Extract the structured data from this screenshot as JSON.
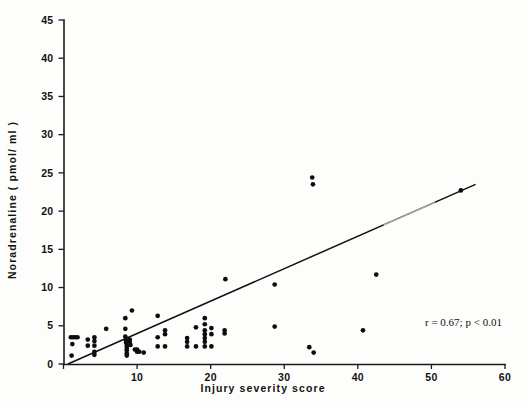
{
  "figure": {
    "background_color": "#fdfdfb",
    "ink_color": "#111111"
  },
  "annotation": {
    "text": "r = 0.67; p < 0.01",
    "r_value": 0.67,
    "p_text": "p < 0.01"
  },
  "chart_data": {
    "type": "scatter",
    "title": "",
    "subtitle": "",
    "xlabel": "Injury severity score",
    "ylabel": "Noradrenaline ( pmol/ ml )",
    "xlim": [
      0,
      60
    ],
    "ylim": [
      0,
      45
    ],
    "xticks": [
      0,
      10,
      20,
      30,
      40,
      50,
      60
    ],
    "xtick_labels": [
      "0",
      "10",
      "20",
      "30",
      "40",
      "50",
      "60"
    ],
    "yticks": [
      0,
      5,
      10,
      15,
      20,
      25,
      30,
      35,
      40,
      45
    ],
    "ytick_labels": [
      "0",
      "5",
      "10",
      "15",
      "20",
      "25",
      "30",
      "35",
      "40",
      "45"
    ],
    "grid": false,
    "legend": null,
    "annotations": [
      {
        "text": "r = 0.67; p < 0.01",
        "x": 48.5,
        "y": 4.6
      }
    ],
    "series": [
      {
        "name": "Noradrenaline vs Injury severity score",
        "marker": "filled-circle",
        "color": "#0d0d0d",
        "points": [
          [
            1.0,
            3.5
          ],
          [
            1.3,
            3.5
          ],
          [
            1.6,
            3.5
          ],
          [
            1.9,
            3.5
          ],
          [
            1.2,
            2.6
          ],
          [
            1.1,
            1.1
          ],
          [
            3.3,
            3.2
          ],
          [
            3.3,
            2.4
          ],
          [
            4.2,
            3.5
          ],
          [
            4.2,
            3.0
          ],
          [
            4.2,
            2.4
          ],
          [
            4.2,
            1.6
          ],
          [
            4.2,
            1.2
          ],
          [
            5.8,
            4.6
          ],
          [
            8.4,
            6.0
          ],
          [
            8.4,
            4.6
          ],
          [
            8.4,
            3.6
          ],
          [
            8.5,
            3.1
          ],
          [
            8.5,
            2.8
          ],
          [
            8.6,
            2.4
          ],
          [
            8.6,
            2.1
          ],
          [
            8.6,
            1.8
          ],
          [
            8.6,
            1.4
          ],
          [
            8.6,
            1.1
          ],
          [
            9.0,
            3.2
          ],
          [
            9.0,
            2.9
          ],
          [
            9.1,
            2.5
          ],
          [
            9.3,
            7.0
          ],
          [
            9.7,
            1.9
          ],
          [
            10.0,
            1.9
          ],
          [
            10.0,
            1.6
          ],
          [
            10.3,
            1.6
          ],
          [
            10.9,
            1.5
          ],
          [
            12.8,
            6.3
          ],
          [
            12.8,
            3.5
          ],
          [
            12.8,
            2.3
          ],
          [
            13.8,
            4.4
          ],
          [
            13.8,
            3.9
          ],
          [
            13.8,
            2.3
          ],
          [
            16.8,
            3.4
          ],
          [
            16.8,
            2.9
          ],
          [
            16.8,
            2.3
          ],
          [
            18.0,
            4.8
          ],
          [
            18.0,
            2.3
          ],
          [
            19.2,
            6.0
          ],
          [
            19.2,
            5.2
          ],
          [
            19.2,
            4.4
          ],
          [
            19.2,
            3.9
          ],
          [
            19.2,
            3.4
          ],
          [
            19.2,
            2.9
          ],
          [
            19.2,
            2.3
          ],
          [
            20.1,
            4.7
          ],
          [
            20.1,
            3.9
          ],
          [
            20.1,
            2.3
          ],
          [
            21.9,
            4.4
          ],
          [
            21.9,
            4.0
          ],
          [
            22.0,
            11.1
          ],
          [
            28.7,
            10.4
          ],
          [
            28.7,
            4.9
          ],
          [
            33.4,
            2.2
          ],
          [
            34.0,
            1.5
          ],
          [
            33.8,
            24.4
          ],
          [
            33.9,
            23.5
          ],
          [
            40.7,
            4.4
          ],
          [
            42.5,
            11.7
          ],
          [
            54.0,
            22.7
          ]
        ]
      }
    ],
    "fit_line": {
      "name": "regression-line",
      "x_start": 0.6,
      "y_start": 0.0,
      "x_end": 56.0,
      "y_end": 23.5,
      "slope": 0.424,
      "intercept": -0.25
    }
  }
}
